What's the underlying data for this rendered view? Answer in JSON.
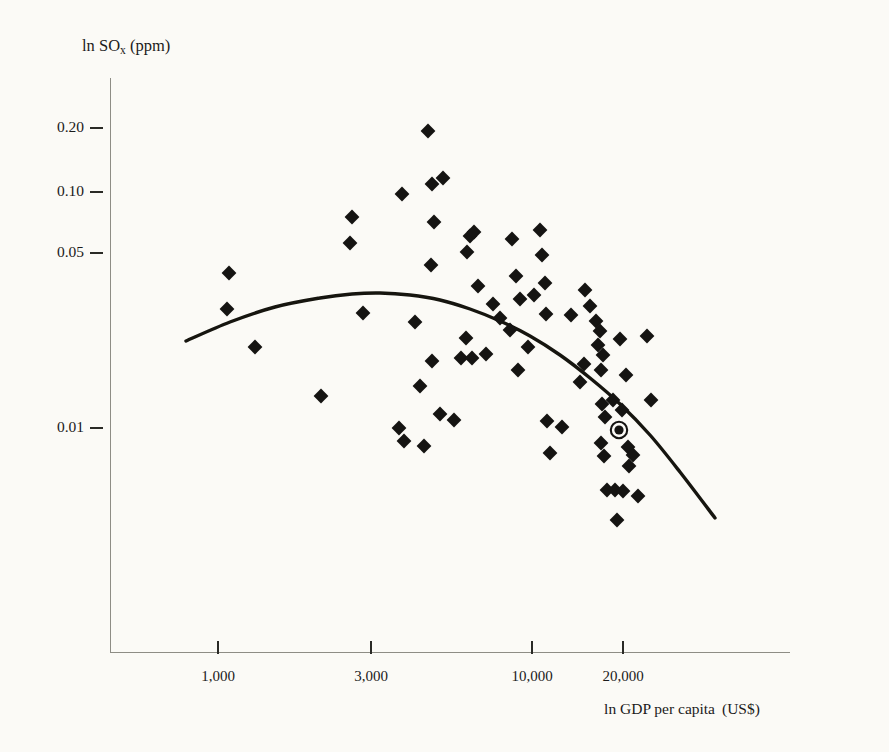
{
  "figure": {
    "background_color": "#fbfaf6",
    "ink_color": "#151412",
    "axis_color": "#8e8d85"
  },
  "axes": {
    "y_title_main": "ln SO",
    "y_title_sub": "x",
    "y_title_unit": "(ppm)",
    "x_title_main": "ln GDP per capita",
    "x_title_unit": "(US$)",
    "y_ticks": [
      {
        "label": "0.20",
        "value": 0.2,
        "y_px": 128
      },
      {
        "label": "0.10",
        "value": 0.1,
        "y_px": 192
      },
      {
        "label": "0.05",
        "value": 0.05,
        "y_px": 253
      },
      {
        "label": "0.01",
        "value": 0.01,
        "y_px": 428
      }
    ],
    "x_ticks": [
      {
        "label": "1,000",
        "value": 1000,
        "x_px": 218
      },
      {
        "label": "3,000",
        "value": 3000,
        "x_px": 371
      },
      {
        "label": "10,000",
        "value": 10000,
        "x_px": 532
      },
      {
        "label": "20,000",
        "value": 20000,
        "x_px": 623
      }
    ]
  },
  "chart_data": {
    "type": "scatter",
    "title": "",
    "subtitle": "",
    "xlabel": "ln GDP per capita (US$)",
    "ylabel": "ln SOx (ppm)",
    "x_scale": "log",
    "y_scale": "log",
    "grid": false,
    "legend_position": "none",
    "xlim": [
      700,
      35000
    ],
    "ylim": [
      0.002,
      0.3
    ],
    "x_tick_values": [
      1000,
      3000,
      10000,
      20000
    ],
    "y_tick_values": [
      0.01,
      0.05,
      0.1,
      0.2
    ],
    "marker_shape": "diamond",
    "marker_color": "#151412",
    "series": [
      {
        "name": "Country observations",
        "marker": "diamond",
        "points": [
          {
            "x_px": 229,
            "y_px": 273
          },
          {
            "x_px": 227,
            "y_px": 309
          },
          {
            "x_px": 255,
            "y_px": 347
          },
          {
            "x_px": 321,
            "y_px": 396
          },
          {
            "x_px": 350,
            "y_px": 243
          },
          {
            "x_px": 352,
            "y_px": 217
          },
          {
            "x_px": 363,
            "y_px": 313
          },
          {
            "x_px": 402,
            "y_px": 194
          },
          {
            "x_px": 404,
            "y_px": 441
          },
          {
            "x_px": 399,
            "y_px": 428
          },
          {
            "x_px": 420,
            "y_px": 386
          },
          {
            "x_px": 415,
            "y_px": 322
          },
          {
            "x_px": 428,
            "y_px": 131
          },
          {
            "x_px": 432,
            "y_px": 184
          },
          {
            "x_px": 443,
            "y_px": 178
          },
          {
            "x_px": 434,
            "y_px": 222
          },
          {
            "x_px": 431,
            "y_px": 265
          },
          {
            "x_px": 432,
            "y_px": 361
          },
          {
            "x_px": 440,
            "y_px": 414
          },
          {
            "x_px": 454,
            "y_px": 420
          },
          {
            "x_px": 461,
            "y_px": 358
          },
          {
            "x_px": 466,
            "y_px": 338
          },
          {
            "x_px": 467,
            "y_px": 252
          },
          {
            "x_px": 470,
            "y_px": 236
          },
          {
            "x_px": 474,
            "y_px": 232
          },
          {
            "x_px": 472,
            "y_px": 358
          },
          {
            "x_px": 478,
            "y_px": 286
          },
          {
            "x_px": 486,
            "y_px": 354
          },
          {
            "x_px": 493,
            "y_px": 304
          },
          {
            "x_px": 500,
            "y_px": 318
          },
          {
            "x_px": 510,
            "y_px": 330
          },
          {
            "x_px": 512,
            "y_px": 239
          },
          {
            "x_px": 518,
            "y_px": 370
          },
          {
            "x_px": 520,
            "y_px": 299
          },
          {
            "x_px": 516,
            "y_px": 276
          },
          {
            "x_px": 528,
            "y_px": 347
          },
          {
            "x_px": 534,
            "y_px": 295
          },
          {
            "x_px": 540,
            "y_px": 230
          },
          {
            "x_px": 542,
            "y_px": 255
          },
          {
            "x_px": 545,
            "y_px": 283
          },
          {
            "x_px": 546,
            "y_px": 314
          },
          {
            "x_px": 547,
            "y_px": 421
          },
          {
            "x_px": 550,
            "y_px": 453
          },
          {
            "x_px": 562,
            "y_px": 427
          },
          {
            "x_px": 571,
            "y_px": 315
          },
          {
            "x_px": 590,
            "y_px": 306
          },
          {
            "x_px": 596,
            "y_px": 321
          },
          {
            "x_px": 598,
            "y_px": 345
          },
          {
            "x_px": 600,
            "y_px": 331
          },
          {
            "x_px": 601,
            "y_px": 370
          },
          {
            "x_px": 603,
            "y_px": 355
          },
          {
            "x_px": 602,
            "y_px": 404
          },
          {
            "x_px": 601,
            "y_px": 443
          },
          {
            "x_px": 604,
            "y_px": 456
          },
          {
            "x_px": 605,
            "y_px": 417
          },
          {
            "x_px": 607,
            "y_px": 490
          },
          {
            "x_px": 615,
            "y_px": 490
          },
          {
            "x_px": 623,
            "y_px": 491
          },
          {
            "x_px": 617,
            "y_px": 520
          },
          {
            "x_px": 613,
            "y_px": 400
          },
          {
            "x_px": 620,
            "y_px": 339
          },
          {
            "x_px": 622,
            "y_px": 410
          },
          {
            "x_px": 626,
            "y_px": 375
          },
          {
            "x_px": 628,
            "y_px": 447
          },
          {
            "x_px": 629,
            "y_px": 466
          },
          {
            "x_px": 633,
            "y_px": 455
          },
          {
            "x_px": 647,
            "y_px": 336
          },
          {
            "x_px": 651,
            "y_px": 400
          },
          {
            "x_px": 580,
            "y_px": 382
          },
          {
            "x_px": 584,
            "y_px": 364
          },
          {
            "x_px": 585,
            "y_px": 290
          },
          {
            "x_px": 638,
            "y_px": 496
          },
          {
            "x_px": 424,
            "y_px": 446
          }
        ]
      },
      {
        "name": "Highlighted observation",
        "marker": "diamond-with-ring",
        "points": [
          {
            "x_px": 619,
            "y_px": 430
          }
        ]
      }
    ],
    "fit_curve": {
      "name": "Fitted quadratic (inverted-U)",
      "shape": "concave-down parabola",
      "path_px": [
        {
          "x_px": 186,
          "y_px": 341
        },
        {
          "x_px": 230,
          "y_px": 322
        },
        {
          "x_px": 275,
          "y_px": 307
        },
        {
          "x_px": 320,
          "y_px": 298
        },
        {
          "x_px": 352,
          "y_px": 294
        },
        {
          "x_px": 380,
          "y_px": 293
        },
        {
          "x_px": 410,
          "y_px": 295
        },
        {
          "x_px": 440,
          "y_px": 300
        },
        {
          "x_px": 470,
          "y_px": 309
        },
        {
          "x_px": 500,
          "y_px": 321
        },
        {
          "x_px": 530,
          "y_px": 336
        },
        {
          "x_px": 560,
          "y_px": 355
        },
        {
          "x_px": 590,
          "y_px": 378
        },
        {
          "x_px": 620,
          "y_px": 404
        },
        {
          "x_px": 650,
          "y_px": 435
        },
        {
          "x_px": 680,
          "y_px": 472
        },
        {
          "x_px": 715,
          "y_px": 518
        }
      ],
      "turning_point_px": {
        "x_px": 378,
        "y_px": 293
      },
      "turning_point_approx": {
        "gdp": 3200,
        "sox": 0.034
      }
    }
  }
}
